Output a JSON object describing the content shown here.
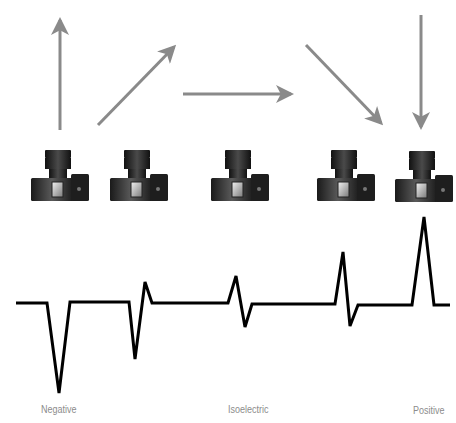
{
  "diagram": {
    "type": "ecg-vector-camera-diagram",
    "arrow_color": "#8a8a8a",
    "trace_color": "#000000",
    "label_color": "#8c8c8c",
    "cameras": [
      {
        "id": "camera-1",
        "x": 31
      },
      {
        "id": "camera-2",
        "x": 123
      },
      {
        "id": "camera-3",
        "x": 211
      },
      {
        "id": "camera-4",
        "x": 317
      },
      {
        "id": "camera-5",
        "x": 395
      }
    ],
    "arrows": [
      {
        "id": "arrow-up",
        "direction": "away",
        "x1": 60,
        "y1": 130,
        "x2": 60,
        "y2": 15
      },
      {
        "id": "arrow-diagonal-away",
        "direction": "away-oblique",
        "x1": 98,
        "y1": 125,
        "x2": 178,
        "y2": 43
      },
      {
        "id": "arrow-horizontal",
        "direction": "perpendicular",
        "x1": 183,
        "y1": 94,
        "x2": 296,
        "y2": 94
      },
      {
        "id": "arrow-diagonal-toward",
        "direction": "toward-oblique",
        "x1": 306,
        "y1": 45,
        "x2": 385,
        "y2": 127
      },
      {
        "id": "arrow-down",
        "direction": "toward",
        "x1": 421,
        "y1": 15,
        "x2": 421,
        "y2": 132
      }
    ],
    "trace_points": "16,303 47,303 59,393 70,302 129,302 135,359 145,282 152,303 228,303 236,276 245,327 252,304 335,304 343,252 350,326 358,305 412,305 424,217 434,305 450,305",
    "labels": {
      "negative": "Negative",
      "isoelectric": "Isoelectric",
      "positive": "Positive"
    }
  }
}
